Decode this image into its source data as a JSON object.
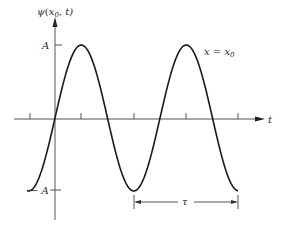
{
  "figure": {
    "y_axis_label": "ψ(x₀, t)",
    "y_axis_label_parts": {
      "func": "ψ",
      "open": "(",
      "var": "x",
      "sub": "0",
      "rest": ", t)"
    },
    "x_axis_label": "t",
    "amplitude_top_label": "A",
    "amplitude_bottom_label": "− A",
    "curve_annotation": "x = x₀",
    "curve_annotation_parts": {
      "lhs": "x",
      "eq": " = ",
      "rhs": "x",
      "sub": "0"
    },
    "period_label": "τ",
    "colors": {
      "line": "#1a1a1a",
      "axis": "#555555",
      "text": "#2a2a2a",
      "background": "#ffffff"
    }
  },
  "chart_data": {
    "type": "line",
    "title": "",
    "xlabel": "t",
    "ylabel": "ψ(x₀, t)",
    "series": [
      {
        "name": "x = x₀",
        "function": "A·sin(2πt/τ)"
      }
    ],
    "y_ticks": [
      "A",
      "−A"
    ],
    "x_tick_count": 5,
    "annotations": [
      "x = x₀",
      "τ (period, min-to-min)"
    ],
    "ylim": [
      "−A",
      "A"
    ],
    "grid": false
  }
}
